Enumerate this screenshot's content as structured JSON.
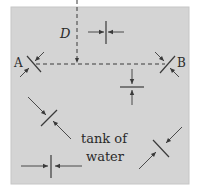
{
  "diagram": {
    "labels": {
      "point_a": "A",
      "point_b": "B",
      "depth": "D",
      "tank_line1": "tank of",
      "tank_line2": "water"
    },
    "colors": {
      "tank_fill": "#d4d4d4",
      "tank_border": "#c8c8c8",
      "line": "#3a3a3a"
    },
    "surfaces": [
      {
        "id": "vertical-top",
        "orientation": "vertical",
        "description": "pressure arrows pointing horizontally at a vertical surface"
      },
      {
        "id": "horizontal-mid",
        "orientation": "horizontal",
        "description": "pressure arrows pointing vertically at a horizontal surface"
      },
      {
        "id": "diagonal-left",
        "orientation": "diagonal",
        "description": "pressure arrows at a slanted surface"
      },
      {
        "id": "diagonal-right",
        "orientation": "diagonal",
        "description": "pressure arrows at a slanted surface"
      },
      {
        "id": "vertical-bottom",
        "orientation": "vertical",
        "description": "pressure arrows pointing horizontally at a vertical surface"
      },
      {
        "id": "point-a",
        "orientation": "diagonal",
        "description": "surface at point A"
      },
      {
        "id": "point-b",
        "orientation": "diagonal",
        "description": "surface at point B"
      }
    ]
  }
}
